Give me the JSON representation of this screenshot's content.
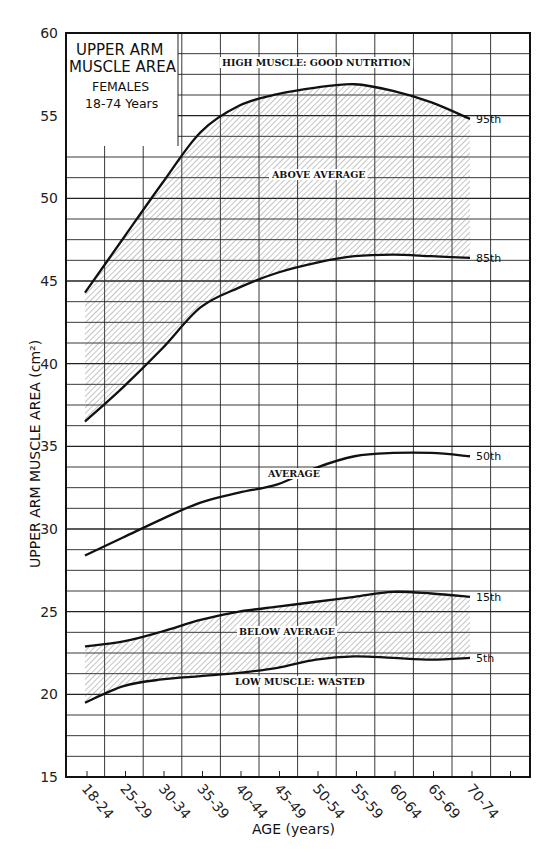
{
  "chart_data": {
    "type": "line",
    "title": "UPPER ARM MUSCLE AREA",
    "subtitle": [
      "FEMALES",
      "18-74 Years"
    ],
    "xlabel": "AGE (years)",
    "ylabel": "UPPER ARM MUSCLE AREA (cm²)",
    "ylim": [
      15,
      60
    ],
    "yticks": [
      15,
      20,
      25,
      30,
      35,
      40,
      45,
      50,
      55,
      60
    ],
    "grid": true,
    "categories": [
      "18-24",
      "25-29",
      "30-34",
      "35-39",
      "40-44",
      "45-49",
      "50-54",
      "55-59",
      "60-64",
      "65-69",
      "70-74"
    ],
    "series": [
      {
        "name": "95th",
        "values": [
          44.3,
          47.6,
          50.9,
          54.0,
          55.6,
          56.3,
          56.7,
          56.9,
          56.5,
          55.8,
          54.8
        ]
      },
      {
        "name": "85th",
        "values": [
          36.5,
          38.6,
          40.9,
          43.4,
          44.6,
          45.5,
          46.1,
          46.5,
          46.6,
          46.5,
          46.4
        ]
      },
      {
        "name": "50th",
        "values": [
          28.4,
          29.5,
          30.6,
          31.6,
          32.2,
          32.7,
          33.7,
          34.4,
          34.6,
          34.6,
          34.4
        ]
      },
      {
        "name": "15th",
        "values": [
          22.9,
          23.2,
          23.8,
          24.5,
          25.0,
          25.3,
          25.6,
          25.9,
          26.2,
          26.1,
          25.9
        ]
      },
      {
        "name": "5th",
        "values": [
          19.5,
          20.5,
          20.9,
          21.1,
          21.3,
          21.6,
          22.1,
          22.3,
          22.2,
          22.1,
          22.2
        ]
      }
    ],
    "shaded_bands": [
      {
        "between": [
          "85th",
          "95th"
        ],
        "label": "ABOVE AVERAGE"
      },
      {
        "between": [
          "5th",
          "15th"
        ],
        "label": "BELOW AVERAGE"
      }
    ],
    "annotations": [
      "HIGH MUSCLE: GOOD NUTRITION",
      "ABOVE AVERAGE",
      "AVERAGE",
      "BELOW AVERAGE",
      "LOW MUSCLE: WASTED"
    ]
  },
  "labels": {
    "title1": "UPPER ARM",
    "title2": "MUSCLE AREA",
    "sub1": "FEMALES",
    "sub2": "18-74 Years",
    "xlabel": "AGE  (years)",
    "ylabel": "UPPER ARM  MUSCLE  AREA  (cm²)",
    "high": "HIGH MUSCLE: GOOD NUTRITION",
    "above": "ABOVE AVERAGE",
    "average": "AVERAGE",
    "below": "BELOW AVERAGE",
    "low": "LOW MUSCLE: WASTED"
  }
}
